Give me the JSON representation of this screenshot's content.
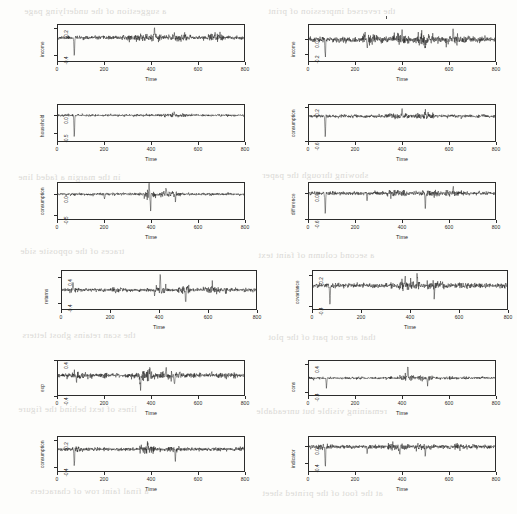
{
  "figure": {
    "kind": "multi-panel-residual-time-series",
    "n_panels": 12,
    "columns": 2,
    "rows": 6,
    "xlabel": "Time",
    "ink_color": "#1d1d1d",
    "background": "#fdfdfb"
  },
  "chart_data": [
    {
      "id": "panel-1",
      "type": "line",
      "title": "",
      "ylabel": "income",
      "xlabel": "Time",
      "xlim": [
        0,
        800
      ],
      "ylim": [
        -0.55,
        0.3
      ],
      "xticks": [
        0,
        200,
        400,
        600,
        800
      ],
      "xticklabels": [
        "0",
        "200",
        "400",
        "600",
        "800"
      ],
      "yticks": [
        -0.4,
        0.2
      ],
      "yticklabels": [
        "-0.4",
        "0.2"
      ],
      "grid": false,
      "legend": "none",
      "series_note": "near-zero residual noise, sd~0.035, spike down at t=70, up-excursion near t=415, elevated variance 470-540 and 660-700",
      "spikes": [
        {
          "t": 70,
          "value": -0.5
        },
        {
          "t": 415,
          "value": 0.22
        },
        {
          "t": 500,
          "value": 0.12
        },
        {
          "t": 675,
          "value": 0.14
        }
      ]
    },
    {
      "id": "panel-2",
      "type": "line",
      "title": "",
      "ylabel": "income",
      "xlabel": "Time",
      "xlim": [
        0,
        800
      ],
      "ylim": [
        -0.32,
        0.22
      ],
      "xticks": [
        0,
        200,
        400,
        600,
        800
      ],
      "xticklabels": [
        "0",
        "200",
        "400",
        "600",
        "800"
      ],
      "yticks": [
        -0.2,
        0.0
      ],
      "yticklabels": [
        "-0.2",
        "0.0"
      ],
      "grid": false,
      "legend": "none",
      "series_note": "residual noise sd~0.035, sharp negative spike t=70, moderate excursions t=250,400,500,620",
      "spikes": [
        {
          "t": 70,
          "value": -0.3
        },
        {
          "t": 250,
          "value": -0.14
        },
        {
          "t": 400,
          "value": 0.12
        },
        {
          "t": 500,
          "value": -0.16
        },
        {
          "t": 620,
          "value": 0.13
        }
      ]
    },
    {
      "id": "panel-3",
      "type": "line",
      "title": "",
      "ylabel": "household",
      "xlabel": "Time",
      "xlim": [
        0,
        800
      ],
      "ylim": [
        -0.75,
        0.3
      ],
      "xticks": [
        0,
        200,
        400,
        600,
        800
      ],
      "xticklabels": [
        "0",
        "200",
        "400",
        "600",
        "800"
      ],
      "yticks": [
        -0.5,
        0.0
      ],
      "yticklabels": [
        "-0.5",
        "0.0"
      ],
      "grid": false,
      "legend": "none",
      "series_note": "flat residuals with one deep negative spike at t=70",
      "spikes": [
        {
          "t": 70,
          "value": -0.68
        },
        {
          "t": 500,
          "value": 0.1
        }
      ]
    },
    {
      "id": "panel-4",
      "type": "line",
      "title": "",
      "ylabel": "consumption",
      "xlabel": "Time",
      "xlim": [
        0,
        800
      ],
      "ylim": [
        -0.62,
        0.28
      ],
      "xticks": [
        0,
        200,
        400,
        600,
        800
      ],
      "xticklabels": [
        "0",
        "200",
        "400",
        "600",
        "800"
      ],
      "yticks": [
        -0.6,
        0.2
      ],
      "yticklabels": [
        "-0.6",
        "0.2"
      ],
      "grid": false,
      "legend": "none",
      "series_note": "residuals sd~0.04, deep negative spike t=70, bursts near t=400 and t=500",
      "spikes": [
        {
          "t": 70,
          "value": -0.58
        },
        {
          "t": 400,
          "value": 0.16
        },
        {
          "t": 500,
          "value": 0.15
        }
      ]
    },
    {
      "id": "panel-5",
      "type": "line",
      "title": "",
      "ylabel": "consumption",
      "xlabel": "Time",
      "xlim": [
        0,
        800
      ],
      "ylim": [
        -0.62,
        0.28
      ],
      "xticks": [
        0,
        200,
        400,
        600,
        800
      ],
      "xticklabels": [
        "0",
        "200",
        "400",
        "600",
        "800"
      ],
      "yticks": [
        -0.5,
        0.0
      ],
      "yticklabels": [
        "-0.5",
        "0.0"
      ],
      "grid": false,
      "legend": "none",
      "series_note": "large upward burst at t=390-400, secondary cluster 450-520, small dip t=200",
      "spikes": [
        {
          "t": 200,
          "value": -0.14
        },
        {
          "t": 392,
          "value": 0.26
        },
        {
          "t": 398,
          "value": -0.52
        },
        {
          "t": 465,
          "value": 0.17
        },
        {
          "t": 505,
          "value": -0.2
        }
      ]
    },
    {
      "id": "panel-6",
      "type": "line",
      "title": "",
      "ylabel": "difference",
      "xlabel": "Time",
      "xlim": [
        0,
        800
      ],
      "ylim": [
        -0.62,
        0.25
      ],
      "xticks": [
        0,
        200,
        400,
        600,
        800
      ],
      "xticklabels": [
        "0",
        "200",
        "400",
        "600",
        "800"
      ],
      "yticks": [
        -0.6,
        0.0
      ],
      "yticklabels": [
        "-0.6",
        "0.0"
      ],
      "grid": false,
      "legend": "none",
      "series_note": "dense residual band, negative spikes at t=70 and t=500, moderate at t=250 and t=620",
      "spikes": [
        {
          "t": 70,
          "value": -0.55
        },
        {
          "t": 250,
          "value": -0.22
        },
        {
          "t": 500,
          "value": -0.4
        },
        {
          "t": 620,
          "value": 0.16
        }
      ]
    },
    {
      "id": "panel-7",
      "type": "line",
      "title": "",
      "ylabel": "returns",
      "xlabel": "Time",
      "xlim": [
        0,
        800
      ],
      "ylim": [
        -0.62,
        0.62
      ],
      "xticks": [
        0,
        200,
        400,
        600,
        800
      ],
      "xticklabels": [
        "0",
        "200",
        "400",
        "600",
        "800"
      ],
      "yticks": [
        -0.4,
        0.4
      ],
      "yticklabels": [
        "-0.4",
        "0.4"
      ],
      "grid": false,
      "legend": "none",
      "series_note": "wide panel; sharp up spike t=405, deep down spike t=510, clusters 40-60 and 200-260 and 580-660",
      "spikes": [
        {
          "t": 45,
          "value": 0.22
        },
        {
          "t": 405,
          "value": 0.56
        },
        {
          "t": 510,
          "value": -0.52
        },
        {
          "t": 620,
          "value": 0.24
        }
      ]
    },
    {
      "id": "panel-8",
      "type": "line",
      "title": "",
      "ylabel": "covariance",
      "xlabel": "Time",
      "xlim": [
        0,
        800
      ],
      "ylim": [
        -0.48,
        0.3
      ],
      "xticks": [
        0,
        200,
        400,
        600,
        800
      ],
      "xticklabels": [
        "0",
        "200",
        "400",
        "600",
        "800"
      ],
      "yticks": [
        -0.4,
        0.2
      ],
      "yticklabels": [
        "-0.4",
        "0.2"
      ],
      "grid": false,
      "legend": "none",
      "series_note": "wide panel; deep negative spike at t=70, elevated variance 350-520, steady tail",
      "spikes": [
        {
          "t": 70,
          "value": -0.44
        },
        {
          "t": 380,
          "value": 0.19
        },
        {
          "t": 430,
          "value": 0.2
        },
        {
          "t": 500,
          "value": -0.26
        }
      ]
    },
    {
      "id": "panel-9",
      "type": "line",
      "title": "",
      "ylabel": "exp",
      "xlabel": "Time",
      "xlim": [
        0,
        800
      ],
      "ylim": [
        -0.3,
        0.22
      ],
      "xticks": [
        0,
        200,
        400,
        600,
        800
      ],
      "xticklabels": [
        "0",
        "200",
        "400",
        "600",
        "800"
      ],
      "yticks": [
        -0.4,
        0.4
      ],
      "yticklabels": [
        "-0.4",
        "0.4"
      ],
      "grid": false,
      "legend": "none",
      "series_note": "quiet first half; activity cluster 350-520 with spikes at 355, 395, 465, 500",
      "spikes": [
        {
          "t": 80,
          "value": -0.12
        },
        {
          "t": 355,
          "value": -0.26
        },
        {
          "t": 395,
          "value": 0.16
        },
        {
          "t": 465,
          "value": 0.14
        },
        {
          "t": 500,
          "value": -0.16
        }
      ]
    },
    {
      "id": "panel-10",
      "type": "line",
      "title": "",
      "ylabel": "cons",
      "xlabel": "Time",
      "xlim": [
        0,
        800
      ],
      "ylim": [
        -0.5,
        0.5
      ],
      "xticks": [
        0,
        200,
        400,
        600,
        800
      ],
      "xticklabels": [
        "0",
        "200",
        "400",
        "600",
        "800"
      ],
      "yticks": [
        -0.4,
        0.4
      ],
      "yticklabels": [
        "-0.4",
        "0.4"
      ],
      "grid": false,
      "legend": "none",
      "series_note": "flat band; downward spike t=75, pronounced upward burst near t=425, dip near t=510",
      "spikes": [
        {
          "t": 75,
          "value": -0.3
        },
        {
          "t": 425,
          "value": 0.42
        },
        {
          "t": 510,
          "value": -0.22
        }
      ]
    },
    {
      "id": "panel-11",
      "type": "line",
      "title": "",
      "ylabel": "consumption",
      "xlabel": "Time",
      "xlim": [
        0,
        800
      ],
      "ylim": [
        -0.5,
        0.28
      ],
      "xticks": [
        0,
        200,
        400,
        600,
        800
      ],
      "xticklabels": [
        "0",
        "200",
        "400",
        "600",
        "800"
      ],
      "yticks": [
        -0.4,
        0.2
      ],
      "yticklabels": [
        "-0.4",
        "0.2"
      ],
      "grid": false,
      "legend": "none",
      "series_note": "deep negative spike t=70, cluster 370-400, downward spike t=505",
      "spikes": [
        {
          "t": 70,
          "value": -0.42
        },
        {
          "t": 385,
          "value": 0.14
        },
        {
          "t": 505,
          "value": -0.3
        }
      ]
    },
    {
      "id": "panel-12",
      "type": "line",
      "title": "",
      "ylabel": "indicator",
      "xlabel": "Time",
      "xlim": [
        0,
        800
      ],
      "ylim": [
        -0.62,
        0.25
      ],
      "xticks": [
        0,
        200,
        400,
        600,
        800
      ],
      "xticklabels": [
        "0",
        "200",
        "400",
        "600",
        "800"
      ],
      "yticks": [
        -0.4,
        0.0
      ],
      "yticklabels": [
        "-0.4",
        "0.0"
      ],
      "grid": false,
      "legend": "none",
      "series_note": "deep negative spike t=70 reaching panel floor, moderate dips t=250, t=390, t=500",
      "spikes": [
        {
          "t": 70,
          "value": -0.58
        },
        {
          "t": 250,
          "value": -0.2
        },
        {
          "t": 390,
          "value": -0.18
        },
        {
          "t": 500,
          "value": -0.22
        }
      ]
    }
  ],
  "bleed_through": [
    {
      "text": "a suggestion of the underlying page",
      "x": 24,
      "y": 6
    },
    {
      "text": "the reversed impression of print",
      "x": 268,
      "y": 6
    },
    {
      "text": "in the margin a faded line",
      "x": 18,
      "y": 172
    },
    {
      "text": "showing through the paper",
      "x": 262,
      "y": 170
    },
    {
      "text": "traces of the opposite side",
      "x": 20,
      "y": 246
    },
    {
      "text": "a second column of faint text",
      "x": 258,
      "y": 250
    },
    {
      "text": "the scan retains ghost letters",
      "x": 22,
      "y": 330
    },
    {
      "text": "that are not part of the plot",
      "x": 268,
      "y": 332
    },
    {
      "text": "lines of text behind the figure",
      "x": 18,
      "y": 404
    },
    {
      "text": "remaining visible but unreadable",
      "x": 256,
      "y": 406
    },
    {
      "text": "a final faint row of characters",
      "x": 30,
      "y": 486
    },
    {
      "text": "at the foot of the printed sheet",
      "x": 262,
      "y": 488
    }
  ]
}
